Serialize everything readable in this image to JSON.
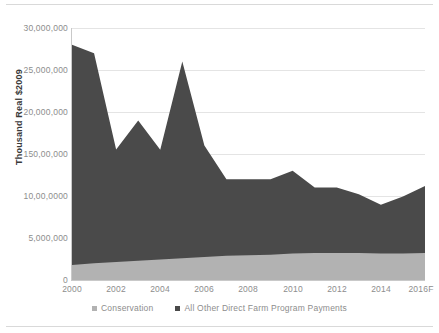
{
  "chart_data": {
    "type": "area",
    "stacked": true,
    "title": "",
    "xlabel": "",
    "ylabel": "Thousand Real $2009",
    "x": [
      2000,
      2001,
      2002,
      2003,
      2004,
      2005,
      2006,
      2007,
      2008,
      2009,
      2010,
      2011,
      2012,
      2013,
      2014,
      2015,
      2016
    ],
    "xtick_labels": [
      "2000",
      "2002",
      "2004",
      "2006",
      "2008",
      "2010",
      "2012",
      "2014",
      "2016F"
    ],
    "xtick_values": [
      2000,
      2002,
      2004,
      2006,
      2008,
      2010,
      2012,
      2014,
      2016
    ],
    "ytick_labels": [
      "0",
      "5,000,000",
      "10,00,0000",
      "150,00,000",
      "20,000,000",
      "25,000,000",
      "30,000,000"
    ],
    "ytick_values": [
      0,
      5000000,
      10000000,
      15000000,
      20000000,
      25000000,
      30000000
    ],
    "ylim": [
      0,
      30000000
    ],
    "xlim": [
      2000,
      2016
    ],
    "grid": true,
    "legend_position": "bottom",
    "series": [
      {
        "name": "Conservation",
        "color": "#b2b2b2",
        "values": [
          1800000,
          2000000,
          2150000,
          2300000,
          2450000,
          2600000,
          2750000,
          2900000,
          2950000,
          3000000,
          3150000,
          3200000,
          3200000,
          3200000,
          3150000,
          3150000,
          3200000
        ]
      },
      {
        "name": "All Other Direct Farm Program Payments",
        "color": "#4a4a4a",
        "values": [
          26200000,
          25000000,
          13400000,
          16700000,
          13050000,
          23400000,
          13250000,
          9100000,
          9050000,
          9000000,
          9850000,
          7800000,
          7800000,
          7000000,
          5800000,
          6800000,
          8000000
        ]
      }
    ],
    "totals": [
      28000000,
      27000000,
      15550000,
      19000000,
      15500000,
      26000000,
      16000000,
      12000000,
      12000000,
      12000000,
      13000000,
      11000000,
      11000000,
      10200000,
      8950000,
      9950000,
      11200000
    ]
  },
  "legend": {
    "items": [
      {
        "label": "Conservation",
        "color": "#b2b2b2"
      },
      {
        "label": "All Other Direct Farm Program Payments",
        "color": "#4a4a4a"
      }
    ]
  }
}
